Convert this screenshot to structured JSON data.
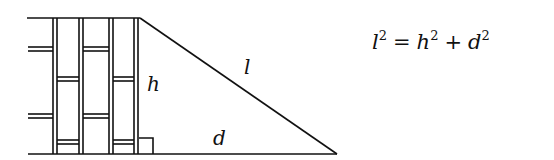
{
  "diagram": {
    "type": "ladder-against-wall right triangle",
    "labels": {
      "height": "h",
      "length": "l",
      "distance": "d"
    },
    "equation": {
      "lhs_var": "l",
      "lhs_exp": "2",
      "equals": "=",
      "term1_var": "h",
      "term1_exp": "2",
      "plus": "+",
      "term2_var": "d",
      "term2_exp": "2"
    },
    "colors": {
      "stroke": "#111111",
      "background": "#ffffff"
    }
  }
}
